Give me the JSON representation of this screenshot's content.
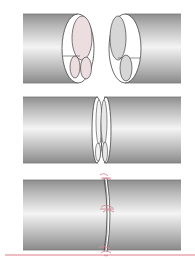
{
  "figure": {
    "colors": {
      "background": "#ffffff",
      "tube_dark": "#9a9a9a",
      "tube_light": "#f2f2f2",
      "outline": "#444444",
      "fascicle_pink": "#ecdde0",
      "fascicle_gray": "#d6d6d6",
      "suture": "#d98a9a",
      "baseline": "#e07a8a"
    },
    "panels": [
      {
        "step": 1,
        "label": "Separated ends showing internal fascicles"
      },
      {
        "step": 2,
        "label": "Ends approximated"
      },
      {
        "step": 3,
        "label": "Ends joined with sutures"
      }
    ]
  }
}
